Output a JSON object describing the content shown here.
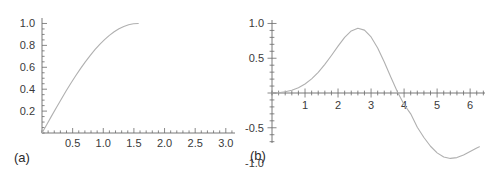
{
  "figure": {
    "background": "#ffffff",
    "curve_color": "#b0b0b0",
    "axis_color": "#555555",
    "tick_color": "#6b6b6b",
    "text_color": "#2b2b2b",
    "panel_a_label": "(a)",
    "panel_b_label": "(b)"
  },
  "chart_data": [
    {
      "type": "line",
      "panel": "(a)",
      "title": "",
      "xlabel": "",
      "ylabel": "",
      "xlim": [
        0,
        3.15
      ],
      "ylim": [
        0,
        1.05
      ],
      "grid": false,
      "legend": null,
      "axis_style": "half-frame bottom-left axes with minor ticks",
      "xticks": [
        0.5,
        1.0,
        1.5,
        2.0,
        2.5,
        3.0
      ],
      "xticklabels": [
        "0.5",
        "1.0",
        "1.5",
        "2.0",
        "2.5",
        "3.0"
      ],
      "yticks": [
        0.2,
        0.4,
        0.6,
        0.8,
        1.0
      ],
      "yticklabels": [
        "0.2",
        "0.4",
        "0.6",
        "0.8",
        "1.0"
      ],
      "xminor_step": 0.1,
      "yminor_step": 0.05,
      "series": [
        {
          "name": "sin(x)",
          "color": "#b0b0b0",
          "x": [
            0.0,
            0.0785,
            0.1571,
            0.2356,
            0.3142,
            0.3927,
            0.4712,
            0.5498,
            0.6283,
            0.7069,
            0.7854,
            0.8639,
            0.9425,
            1.021,
            1.0996,
            1.1781,
            1.2566,
            1.3352,
            1.4137,
            1.4923,
            1.5708
          ],
          "y": [
            0.0,
            0.0785,
            0.1564,
            0.2334,
            0.309,
            0.3827,
            0.454,
            0.5225,
            0.5878,
            0.6494,
            0.7071,
            0.7604,
            0.809,
            0.8526,
            0.891,
            0.9239,
            0.9511,
            0.9724,
            0.9877,
            0.9969,
            1.0
          ]
        }
      ]
    },
    {
      "type": "line",
      "panel": "(b)",
      "title": "",
      "xlabel": "",
      "ylabel": "",
      "xlim": [
        0,
        6.45
      ],
      "ylim": [
        -1.05,
        1.05
      ],
      "grid": false,
      "legend": null,
      "axis_style": "cross axes through origin with minor ticks",
      "xticks": [
        1,
        2,
        3,
        4,
        5,
        6
      ],
      "xticklabels": [
        "1",
        "2",
        "3",
        "4",
        "5",
        "6"
      ],
      "yticks": [
        -1.0,
        -0.5,
        0.0,
        0.5,
        1.0
      ],
      "yticklabels": [
        "-1.0",
        "-0.5",
        "",
        "0.5",
        "1.0"
      ],
      "xminor_step": 0.2,
      "yminor_step": 0.1,
      "annotations": {
        "peak": {
          "x": 2.6,
          "y": 0.93
        },
        "zero_crossing": {
          "x": 4.15,
          "y": 0.0
        },
        "trough": {
          "x": 5.7,
          "y": -0.93
        }
      },
      "series": [
        {
          "name": "modulated-sine",
          "color": "#b0b0b0",
          "x": [
            0.0,
            0.2,
            0.4,
            0.6,
            0.8,
            1.0,
            1.2,
            1.4,
            1.6,
            1.8,
            2.0,
            2.2,
            2.4,
            2.6,
            2.8,
            3.0,
            3.2,
            3.4,
            3.6,
            3.8,
            4.0,
            4.2,
            4.4,
            4.6,
            4.8,
            5.0,
            5.2,
            5.4,
            5.6,
            5.8,
            6.0,
            6.2,
            6.28
          ],
          "y": [
            0.0,
            0.004,
            0.017,
            0.04,
            0.077,
            0.13,
            0.203,
            0.297,
            0.411,
            0.54,
            0.675,
            0.8,
            0.893,
            0.932,
            0.904,
            0.806,
            0.648,
            0.447,
            0.227,
            0.015,
            -0.166,
            -0.3,
            -0.492,
            -0.64,
            -0.766,
            -0.861,
            -0.921,
            -0.941,
            -0.929,
            -0.892,
            -0.84,
            -0.79,
            -0.773
          ]
        }
      ]
    }
  ]
}
